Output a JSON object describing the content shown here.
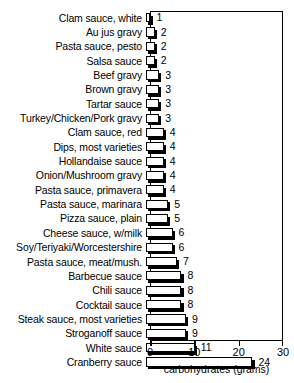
{
  "title_partial": "",
  "chart_data": {
    "type": "bar",
    "orientation": "horizontal",
    "title": "",
    "xlabel": "carbohydrates (grams)",
    "ylabel": "",
    "xlim": [
      0,
      30
    ],
    "xticks": [
      0,
      10,
      20,
      30
    ],
    "xtick_labels": [
      "0",
      "10",
      "20",
      "30"
    ],
    "grid": false,
    "legend": false,
    "categories": [
      "Clam sauce, white",
      "Au jus gravy",
      "Pasta sauce, pesto",
      "Salsa sauce",
      "Beef gravy",
      "Brown gravy",
      "Tartar sauce",
      "Turkey/Chicken/Pork gravy",
      "Clam sauce, red",
      "Dips, most varieties",
      "Hollandaise sauce",
      "Onion/Mushroom gravy",
      "Pasta sauce, primavera",
      "Pasta sauce, marinara",
      "Pizza sauce, plain",
      "Cheese sauce, w/milk",
      "Soy/Teriyaki/Worcestershire",
      "Pasta sauce, meat/mush.",
      "Barbecue sauce",
      "Chili sauce",
      "Cocktail sauce",
      "Steak sauce, most varieties",
      "Stroganoff sauce",
      "White sauce",
      "Cranberry sauce"
    ],
    "values": [
      1,
      2,
      2,
      2,
      3,
      3,
      3,
      3,
      4,
      4,
      4,
      4,
      4,
      5,
      5,
      6,
      6,
      7,
      8,
      8,
      8,
      9,
      9,
      11,
      24
    ],
    "value_labels": [
      "1",
      "2",
      "2",
      "2",
      "3",
      "3",
      "3",
      "3",
      "4",
      "4",
      "4",
      "4",
      "4",
      "5",
      "5",
      "6",
      "6",
      "7",
      "8",
      "8",
      "8",
      "9",
      "9",
      "11",
      "24"
    ],
    "bar_fill": "#ffffff",
    "bar_edge": "#000000",
    "bar_shadow": "#000000"
  }
}
